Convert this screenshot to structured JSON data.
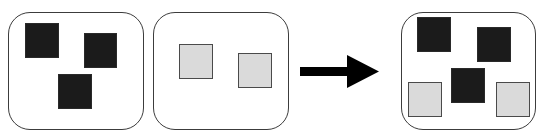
{
  "diagram": {
    "colors": {
      "panel_border": "#3c3c3c",
      "dark_square": "#1b1b1b",
      "light_square_fill": "#dadada",
      "light_square_border": "#4a4a4a",
      "arrow": "#000000"
    },
    "panels": [
      {
        "name": "set-dark",
        "box": {
          "x": 8,
          "y": 12,
          "w": 136,
          "h": 118
        },
        "items": [
          {
            "type": "dark",
            "x": 25,
            "y": 23,
            "w": 34,
            "h": 35
          },
          {
            "type": "dark",
            "x": 84,
            "y": 33,
            "w": 33,
            "h": 35
          },
          {
            "type": "dark",
            "x": 58,
            "y": 74,
            "w": 34,
            "h": 35
          }
        ]
      },
      {
        "name": "set-light",
        "box": {
          "x": 153,
          "y": 12,
          "w": 136,
          "h": 118
        },
        "items": [
          {
            "type": "light",
            "x": 179,
            "y": 44,
            "w": 34,
            "h": 35
          },
          {
            "type": "light",
            "x": 238,
            "y": 53,
            "w": 34,
            "h": 35
          }
        ]
      },
      {
        "name": "set-combined",
        "box": {
          "x": 401,
          "y": 12,
          "w": 135,
          "h": 118
        },
        "items": [
          {
            "type": "dark",
            "x": 417,
            "y": 17,
            "w": 34,
            "h": 35
          },
          {
            "type": "dark",
            "x": 477,
            "y": 27,
            "w": 34,
            "h": 35
          },
          {
            "type": "dark",
            "x": 451,
            "y": 68,
            "w": 34,
            "h": 35
          },
          {
            "type": "light",
            "x": 408,
            "y": 82,
            "w": 34,
            "h": 35
          },
          {
            "type": "light",
            "x": 496,
            "y": 82,
            "w": 34,
            "h": 35
          }
        ]
      }
    ],
    "arrow": {
      "direction": "right",
      "shaft": {
        "x1": 300,
        "x2": 349,
        "y": 71.5,
        "thickness": 9
      },
      "head": {
        "base_x": 347,
        "tip_x": 379,
        "top_y": 55,
        "bottom_y": 88,
        "tip_y": 71.5
      }
    }
  }
}
